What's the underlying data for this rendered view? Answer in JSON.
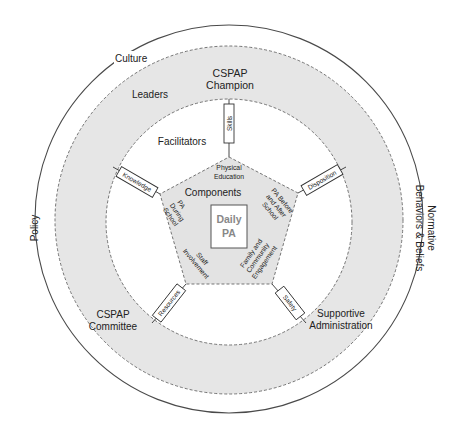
{
  "diagram": {
    "colors": {
      "outer_line": "#4a4a4a",
      "band_fill": "#e6e6e6",
      "pentagon_fill": "#e3e3e3",
      "dashed_line": "#666666",
      "text": "#222222",
      "center_text": "#8a8a8a"
    },
    "outer_ring": {
      "top_label": "Culture",
      "left_label": "Policy",
      "right_label_line1": "Normative",
      "right_label_line2": "Behaviors & Beliefs"
    },
    "leaders_band": {
      "label": "Leaders",
      "top_role_line1": "CSPAP",
      "top_role_line2": "Champion",
      "bottom_left_role_line1": "CSPAP",
      "bottom_left_role_line2": "Committee",
      "bottom_right_role_line1": "Supportive",
      "bottom_right_role_line2": "Administration"
    },
    "facilitators_ring": {
      "label": "Facilitators",
      "connectors": [
        {
          "id": "skills",
          "label": "Skills"
        },
        {
          "id": "knowledge",
          "label": "Knowledge"
        },
        {
          "id": "disposition",
          "label": "Disposition"
        },
        {
          "id": "resources",
          "label": "Resources"
        },
        {
          "id": "safety",
          "label": "Safety"
        }
      ]
    },
    "components_pentagon": {
      "label": "Components",
      "center_line1": "Daily",
      "center_line2": "PA",
      "segments": [
        {
          "id": "physical-education",
          "line1": "Physical",
          "line2": "Education"
        },
        {
          "id": "pa-during-school",
          "line1": "PA",
          "line2": "During",
          "line3": "School"
        },
        {
          "id": "pa-before-after-school",
          "line1": "PA Before",
          "line2": "and After",
          "line3": "School"
        },
        {
          "id": "staff-involvement",
          "line1": "Staff",
          "line2": "Involvement"
        },
        {
          "id": "family-community",
          "line1": "Family and",
          "line2": "Community",
          "line3": "Engagement"
        }
      ]
    }
  }
}
